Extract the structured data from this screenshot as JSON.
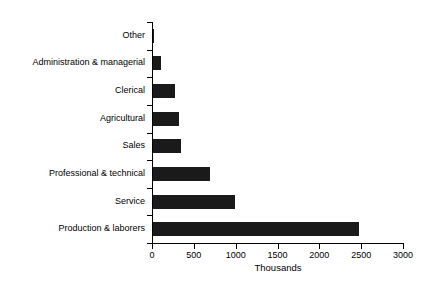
{
  "chart_data": {
    "type": "bar",
    "orientation": "horizontal",
    "title": "",
    "xlabel": "Thousands",
    "ylabel": "",
    "xlim": [
      0,
      3000
    ],
    "xticks": [
      0,
      500,
      1000,
      1500,
      2000,
      2500,
      3000
    ],
    "xtick_labels": [
      "0",
      "500",
      "1000",
      "1500",
      "2000",
      "2500",
      "3000"
    ],
    "grid": false,
    "legend": false,
    "bar_color": "#1a1a1a",
    "axis_color": "#000000",
    "background_color": "#ffffff",
    "categories": [
      "Other",
      "Administration & managerial",
      "Clerical",
      "Agricultural",
      "Sales",
      "Professional & technical",
      "Service",
      "Production & laborers"
    ],
    "values": [
      15,
      100,
      260,
      310,
      335,
      685,
      985,
      2460
    ]
  }
}
